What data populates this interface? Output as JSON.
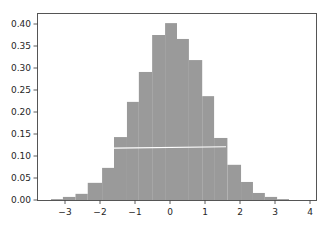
{
  "chart_data": {
    "type": "bar",
    "subtype": "histogram",
    "title": "",
    "xlabel": "",
    "ylabel": "",
    "xlim": [
      -3.8,
      4.2
    ],
    "ylim": [
      0.0,
      0.42
    ],
    "grid": false,
    "legend": null,
    "bar_color": "#9a9a9a",
    "frame_color": "#555555",
    "overlay_line": {
      "color": "#ffffff",
      "x": [
        -1.6,
        1.6
      ],
      "y": [
        0.118,
        0.121
      ]
    },
    "xticks": [
      -3,
      -2,
      -1,
      0,
      1,
      2,
      3,
      4
    ],
    "xtick_labels": [
      "−3",
      "−2",
      "−1",
      "0",
      "1",
      "2",
      "3",
      "4"
    ],
    "yticks": [
      0.0,
      0.05,
      0.1,
      0.15,
      0.2,
      0.25,
      0.3,
      0.35,
      0.4
    ],
    "ytick_labels": [
      "0.00",
      "0.05",
      "0.10",
      "0.15",
      "0.20",
      "0.25",
      "0.30",
      "0.35",
      "0.40"
    ],
    "bin_edges": [
      -3.4,
      -3.06,
      -2.7,
      -2.35,
      -1.94,
      -1.6,
      -1.23,
      -0.89,
      -0.51,
      -0.14,
      0.2,
      0.54,
      0.92,
      1.26,
      1.64,
      2.03,
      2.37,
      2.71,
      3.06,
      3.4
    ],
    "values": [
      0.002,
      0.007,
      0.014,
      0.039,
      0.073,
      0.143,
      0.223,
      0.291,
      0.375,
      0.402,
      0.366,
      0.318,
      0.236,
      0.141,
      0.08,
      0.041,
      0.016,
      0.007,
      0.002
    ]
  }
}
